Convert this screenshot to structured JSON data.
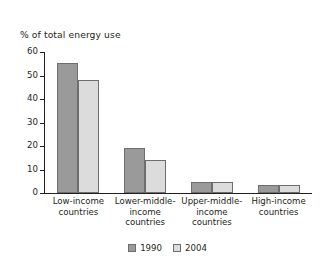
{
  "chart_data": {
    "type": "bar",
    "title": "",
    "ylabel": "% of total energy use",
    "xlabel": "",
    "ylim": [
      0,
      60
    ],
    "yticks": [
      "0",
      "10",
      "20",
      "30",
      "40",
      "50",
      "60"
    ],
    "grid": false,
    "legend_position": "bottom-center",
    "categories": [
      "Low-income\ncountries",
      "Lower-middle-\nincome\ncountries",
      "Upper-middle-\nincome\ncountries",
      "High-income\ncountries"
    ],
    "category_labels": [
      [
        "Low-income",
        "countries"
      ],
      [
        "Lower-middle-",
        "income",
        "countries"
      ],
      [
        "Upper-middle-",
        "income",
        "countries"
      ],
      [
        "High-income",
        "countries"
      ]
    ],
    "series": [
      {
        "name": "1990",
        "color": "#9a9a9a",
        "values": [
          55.5,
          19,
          4.5,
          3.5
        ]
      },
      {
        "name": "2004",
        "color": "#dcdcdc",
        "values": [
          48,
          14,
          4.5,
          3.5
        ]
      }
    ]
  },
  "legend": {
    "items": [
      {
        "label": "1990",
        "swatch": "dark-gray-swatch"
      },
      {
        "label": "2004",
        "swatch": "light-gray-swatch"
      }
    ]
  }
}
